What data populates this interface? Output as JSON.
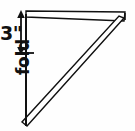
{
  "figure": {
    "background_color": "#fefefe",
    "line_color": "#111111"
  },
  "labels": {
    "dimension": "3\"",
    "fold": "fold"
  },
  "annotations": {
    "dimension_arrow": {
      "name": "three-inch-double-arrow",
      "orientation": "vertical",
      "arrowheads": "both",
      "x": 21,
      "y_top": 12,
      "y_bottom": 53
    },
    "tick_mark": {
      "name": "fold-start-tick",
      "x_start": 18,
      "x_end": 34,
      "y": 53
    }
  },
  "shape": {
    "type": "right-triangle",
    "vertices": {
      "top_left": {
        "x": 26,
        "y": 14
      },
      "top_right": {
        "x": 125,
        "y": 15
      },
      "bottom_left": {
        "x": 26,
        "y": 126
      }
    },
    "edges": [
      {
        "name": "top-flap-band",
        "style": "double-line-tapered"
      },
      {
        "name": "fold-edge-vertical",
        "style": "single-line"
      },
      {
        "name": "hypotenuse-band",
        "style": "double-line-tapered"
      }
    ]
  }
}
